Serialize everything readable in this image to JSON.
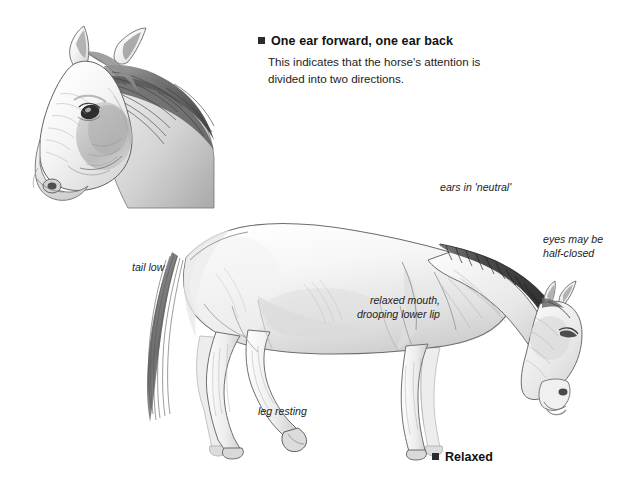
{
  "document": {
    "background_color": "#ffffff",
    "style": "pencil-sketch illustration with italic annotations"
  },
  "callout": {
    "bullet": "square-bullet",
    "title": "One ear forward, one ear back",
    "body": "This indicates that the horse's attention is divided into two directions."
  },
  "caption": {
    "bullet": "square-bullet",
    "label": "Relaxed"
  },
  "annotations": {
    "tail_low": "tail low",
    "leg_resting": "leg resting",
    "ears_neutral": "ears in 'neutral'",
    "eyes_half_closed": "eyes may be\nhalf-closed",
    "relaxed_mouth": "relaxed mouth,\ndrooping lower lip"
  },
  "figures": {
    "head_sketch": "horse-head-three-quarter-view",
    "body_sketch": "horse-full-body-side-view-relaxed"
  },
  "colors": {
    "ink": "#1a1a1a",
    "pencil_dark": "#4a4a4a",
    "pencil_mid": "#8d8d8d",
    "pencil_light": "#c9c9c9",
    "paper": "#ffffff"
  }
}
